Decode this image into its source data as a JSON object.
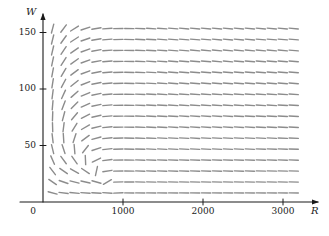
{
  "figure": {
    "kind": "slope-field",
    "background": "#ffffff",
    "ink": "#1a1a1a",
    "segment_color": "#8c8c8c"
  },
  "axes": {
    "x": {
      "label": "R",
      "min": 0,
      "max": 3350,
      "ticks": [
        {
          "value": 1000,
          "label": "1000"
        },
        {
          "value": 2000,
          "label": "2000"
        },
        {
          "value": 3000,
          "label": "3000"
        }
      ],
      "origin_label": "0",
      "pixel_origin": 43,
      "pixel_per_unit": 0.08,
      "arrow": true
    },
    "y": {
      "label": "W",
      "min": 0,
      "max": 172,
      "ticks": [
        {
          "value": 50,
          "label": "50"
        },
        {
          "value": 100,
          "label": "100"
        },
        {
          "value": 150,
          "label": "150"
        }
      ],
      "pixel_origin": 202,
      "pixel_per_unit": 1.13,
      "arrow": true
    }
  },
  "chart_data": {
    "type": "scatter",
    "title": "",
    "xlabel": "R",
    "ylabel": "W",
    "xlim": [
      0,
      3350
    ],
    "ylim": [
      0,
      172
    ],
    "grid": false,
    "legend": null,
    "field": {
      "description": "Direction field of a predator-prey (Lotka-Volterra) system in the R-W plane; trajectories circulate counterclockwise about an equilibrium.",
      "equilibrium": {
        "R": 1000,
        "W": 75
      },
      "model": {
        "dR": "0.08*R*(1 - R/1000) - 0.001*R*W",
        "dW": "-0.02*W + 0.00002*R*W"
      },
      "sample_start_R": 120,
      "sample_step_R": 137,
      "sample_count_R": 23,
      "sample_start_W": 8,
      "sample_step_W": 9.7,
      "sample_count_W": 16,
      "segment_half_length_px": 4.6,
      "segment_width_px": 1.4
    }
  },
  "ticks_render": {
    "tick_len_px": 6,
    "tick_width_px": 1
  }
}
